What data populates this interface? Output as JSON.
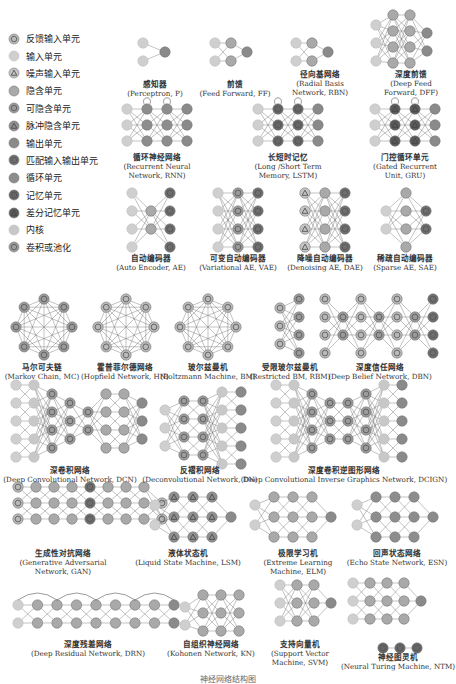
{
  "colors": {
    "backfed_input": "#b9b9b9",
    "input": "#cfcfcf",
    "noisy_input": "#c4c4c4",
    "hidden": "#a9a9a9",
    "probabilistic_hidden": "#9a9a9a",
    "spiking_hidden": "#8f8f8f",
    "output": "#8a8a8a",
    "match_io": "#6e6e6e",
    "recurrent": "#8d8d8d",
    "memory": "#666666",
    "different_memory": "#5a5a5a",
    "kernel": "#c8c8c8",
    "conv_pool": "#9c9c9c",
    "edge": "#555555"
  },
  "legend": [
    {
      "icon": "backfed-input-cell-icon",
      "type": "backfed_input",
      "label": "反馈输入单元"
    },
    {
      "icon": "input-cell-icon",
      "type": "input",
      "label": "输入单元"
    },
    {
      "icon": "noisy-input-cell-icon",
      "type": "noisy_input",
      "label": "噪声输入单元"
    },
    {
      "icon": "hidden-cell-icon",
      "type": "hidden",
      "label": "隐含单元"
    },
    {
      "icon": "probabilistic-hidden-cell-icon",
      "type": "probabilistic_hidden",
      "label": "可隐含单元"
    },
    {
      "icon": "spiking-hidden-cell-icon",
      "type": "spiking_hidden",
      "label": "脉冲隐含单元"
    },
    {
      "icon": "output-cell-icon",
      "type": "output",
      "label": "输出单元"
    },
    {
      "icon": "match-io-cell-icon",
      "type": "match_io",
      "label": "匹配输入输出单元"
    },
    {
      "icon": "recurrent-cell-icon",
      "type": "recurrent",
      "label": "循环单元"
    },
    {
      "icon": "memory-cell-icon",
      "type": "memory",
      "label": "记忆单元"
    },
    {
      "icon": "different-memory-cell-icon",
      "type": "different_memory",
      "label": "差分记忆单元"
    },
    {
      "icon": "kernel-icon",
      "type": "kernel",
      "label": "内核"
    },
    {
      "icon": "conv-pool-icon",
      "type": "conv_pool",
      "label": "卷积或池化"
    }
  ],
  "networks": [
    {
      "id": "p",
      "zh": "感知器",
      "en": [
        "(Perceptron, P)"
      ],
      "cap_x": 155,
      "cap_y": 80
    },
    {
      "id": "ff",
      "zh": "前馈",
      "en": [
        "(Feed Forward, FF)"
      ],
      "cap_x": 235,
      "cap_y": 80
    },
    {
      "id": "rbn",
      "zh": "径向基网络",
      "en": [
        "(Radial Basis",
        "Network, RBN)"
      ],
      "cap_x": 320,
      "cap_y": 70
    },
    {
      "id": "dff",
      "zh": "深度前馈",
      "en": [
        "(Deep Feed",
        "Forward, DFF)"
      ],
      "cap_x": 411,
      "cap_y": 70
    },
    {
      "id": "rnn",
      "zh": "循环神经网络",
      "en": [
        "(Recurrent Neural",
        "Network, RNN)"
      ],
      "cap_x": 157,
      "cap_y": 153
    },
    {
      "id": "lstm",
      "zh": "长短时记忆",
      "en": [
        "(Long /Short Term",
        "Memory, LSTM)"
      ],
      "cap_x": 288,
      "cap_y": 153
    },
    {
      "id": "gru",
      "zh": "门控循环单元",
      "en": [
        "(Gated Recurrent",
        "Unit, GRU)"
      ],
      "cap_x": 405,
      "cap_y": 153
    },
    {
      "id": "ae",
      "zh": "自动编码器",
      "en": [
        "(Auto Encoder, AE)"
      ],
      "cap_x": 151,
      "cap_y": 254
    },
    {
      "id": "vae",
      "zh": "可变自动编码器",
      "en": [
        "(Variational AE, VAE)"
      ],
      "cap_x": 238,
      "cap_y": 254
    },
    {
      "id": "dae",
      "zh": "降噪自动编码器",
      "en": [
        "(Denoising AE, DAE)"
      ],
      "cap_x": 325,
      "cap_y": 254
    },
    {
      "id": "sae",
      "zh": "稀疏自动编码器",
      "en": [
        "(Sparse AE, SAE)"
      ],
      "cap_x": 405,
      "cap_y": 254
    },
    {
      "id": "mc",
      "zh": "马尔可夫链",
      "en": [
        "(Markov Chain, MC)"
      ],
      "cap_x": 42,
      "cap_y": 363
    },
    {
      "id": "hn",
      "zh": "霍普菲尔德网络",
      "en": [
        "(Hopfield Network, HN)"
      ],
      "cap_x": 125,
      "cap_y": 363
    },
    {
      "id": "bm",
      "zh": "玻尔兹曼机",
      "en": [
        "(Boltzmann Machine, BM)"
      ],
      "cap_x": 208,
      "cap_y": 363
    },
    {
      "id": "rbm",
      "zh": "受限玻尔兹曼机",
      "en": [
        "(Restricted BM, RBM)"
      ],
      "cap_x": 290,
      "cap_y": 363
    },
    {
      "id": "dbn",
      "zh": "深度信任网络",
      "en": [
        "(Deep Belief Network, DBN)"
      ],
      "cap_x": 380,
      "cap_y": 363
    },
    {
      "id": "dcn",
      "zh": "深卷积网络",
      "en": [
        "(Deep Convolutional Network, DCN)"
      ],
      "cap_x": 70,
      "cap_y": 466
    },
    {
      "id": "dn",
      "zh": "反褶积网络",
      "en": [
        "(Deconvolutional Network, DN)"
      ],
      "cap_x": 200,
      "cap_y": 466
    },
    {
      "id": "dcign",
      "zh": "深度卷积逆图形网络",
      "en": [
        "(Deep Convolutional Inverse Graphics Network, DCIGN)"
      ],
      "cap_x": 344,
      "cap_y": 466
    },
    {
      "id": "gan",
      "zh": "生成性对抗网络",
      "en": [
        "(Generative Adversarial",
        "Network, GAN)"
      ],
      "cap_x": 63,
      "cap_y": 549
    },
    {
      "id": "lsm",
      "zh": "液体状态机",
      "en": [
        "(Liquid State Machine, LSM)"
      ],
      "cap_x": 188,
      "cap_y": 549
    },
    {
      "id": "elm",
      "zh": "极限学习机",
      "en": [
        "(Extreme Learning",
        "Machine, ELM)"
      ],
      "cap_x": 298,
      "cap_y": 549
    },
    {
      "id": "esn",
      "zh": "回声状态网络",
      "en": [
        "(Echo State Network, ESN)"
      ],
      "cap_x": 397,
      "cap_y": 549
    },
    {
      "id": "drn",
      "zh": "深度残差网络",
      "en": [
        "(Deep Residual Network, DRN)"
      ],
      "cap_x": 88,
      "cap_y": 640
    },
    {
      "id": "kn",
      "zh": "自组织神经网络",
      "en": [
        "(Kohonen Network, KN)"
      ],
      "cap_x": 211,
      "cap_y": 640
    },
    {
      "id": "svm",
      "zh": "支持向量机",
      "en": [
        "(Support Vector",
        "Machine, SVM)"
      ],
      "cap_x": 300,
      "cap_y": 640
    },
    {
      "id": "ntm",
      "zh": "神经图灵机",
      "en": [
        "(Neural Turing Machine, NTM)"
      ],
      "cap_x": 398,
      "cap_y": 653
    }
  ],
  "figure_caption": "神经网络结构图"
}
